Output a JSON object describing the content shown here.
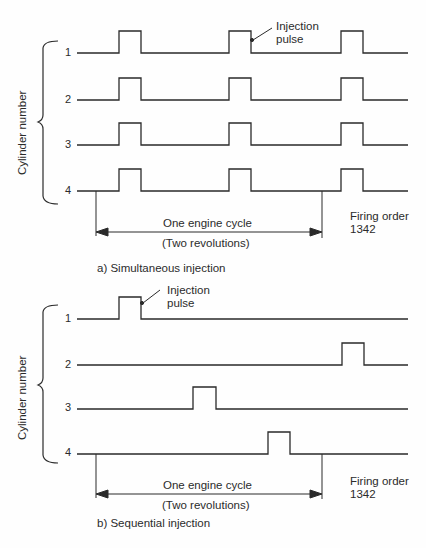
{
  "figure": {
    "panel_a": {
      "caption": "a) Simultaneous injection",
      "y_axis_label": "Cylinder number",
      "cylinders": [
        "1",
        "2",
        "3",
        "4"
      ],
      "annotation": {
        "line1": "Injection",
        "line2": "pulse"
      },
      "cycle_label": {
        "line1": "One engine cycle",
        "line2": "(Two revolutions)"
      },
      "firing_order": {
        "label": "Firing order",
        "value": "1342"
      },
      "pulses": {
        "1": [
          [
            119,
            141
          ],
          [
            229,
            251
          ],
          [
            341,
            363
          ]
        ],
        "2": [
          [
            119,
            141
          ],
          [
            229,
            251
          ],
          [
            341,
            363
          ]
        ],
        "3": [
          [
            119,
            141
          ],
          [
            229,
            251
          ],
          [
            341,
            363
          ]
        ],
        "4": [
          [
            119,
            141
          ],
          [
            229,
            251
          ],
          [
            341,
            363
          ]
        ]
      }
    },
    "panel_b": {
      "caption": "b) Sequential injection",
      "y_axis_label": "Cylinder number",
      "cylinders": [
        "1",
        "2",
        "3",
        "4"
      ],
      "annotation": {
        "line1": "Injection",
        "line2": "pulse"
      },
      "cycle_label": {
        "line1": "One engine cycle",
        "line2": "(Two revolutions)"
      },
      "firing_order": {
        "label": "Firing order",
        "value": "1342"
      },
      "pulses": {
        "1": [
          [
            119,
            141
          ]
        ],
        "2": [
          [
            342,
            364
          ]
        ],
        "3": [
          [
            193,
            216
          ]
        ],
        "4": [
          [
            268,
            290
          ]
        ]
      }
    }
  }
}
